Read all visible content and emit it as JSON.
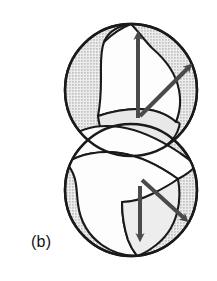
{
  "figure": {
    "panel_label": "(b)",
    "caption_text": "(b)",
    "background_color": "#ffffff",
    "outline_color": "#1a1a1a",
    "sphere_fill_color": "#e2e2e2",
    "sphere_halftone_dot_color": "#b4b4b4",
    "ribbon_fill_color": "#fefefe",
    "arrow_color": "#4a4a4a",
    "elements": {
      "upper_sphere": {
        "name": "upper-sphere",
        "center_x": 131,
        "center_y": 90,
        "radius": 66,
        "shaded": true
      },
      "lower_sphere": {
        "name": "lower-sphere",
        "center_x": 131,
        "center_y": 190,
        "radius": 66,
        "shaded": true
      },
      "helix_ribbon": {
        "name": "helix-ribbon",
        "turns": 2,
        "fill": "white",
        "description": "white helical ribbon winding vertically through both spheres"
      }
    },
    "arrows": [
      {
        "name": "upper-vertical-arrow",
        "direction": "up",
        "x1": 138,
        "y1": 118,
        "x2": 138,
        "y2": 32
      },
      {
        "name": "upper-diagonal-arrow",
        "direction": "up-right",
        "x1": 139,
        "y1": 116,
        "x2": 192,
        "y2": 64
      },
      {
        "name": "lower-vertical-arrow",
        "direction": "down",
        "x1": 140,
        "y1": 186,
        "x2": 140,
        "y2": 240
      },
      {
        "name": "lower-diagonal-arrow",
        "direction": "down-right",
        "x1": 140,
        "y1": 177,
        "x2": 188,
        "y2": 222
      }
    ]
  }
}
